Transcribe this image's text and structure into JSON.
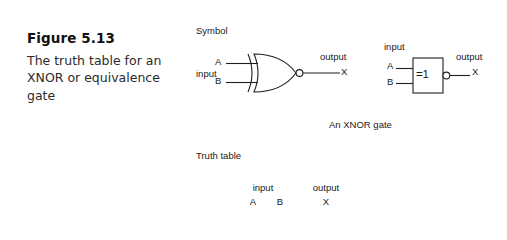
{
  "figure": {
    "number_label": "Figure 5.13",
    "description": "The truth table for an XNOR or equivalence gate"
  },
  "sections": {
    "symbol_label": "Symbol",
    "truth_table_label": "Truth table"
  },
  "distinctive_symbol": {
    "input_group_label": "input",
    "input_a": "A",
    "input_b": "B",
    "output_group_label": "output",
    "output_x": "X",
    "caption": "An XNOR gate",
    "has_inversion_bubble": true
  },
  "iec_symbol": {
    "input_group_label": "input",
    "input_a": "A",
    "input_b": "B",
    "body_text": "=1",
    "output_group_label": "output",
    "output_x": "X",
    "has_inversion_bubble": true
  },
  "truth_table": {
    "group_headers": {
      "input": "input",
      "output": "output"
    },
    "columns": [
      "A",
      "B",
      "X"
    ]
  },
  "colors": {
    "background": "#ffffff",
    "ink": "#1f1f1f",
    "text": "#202020"
  }
}
